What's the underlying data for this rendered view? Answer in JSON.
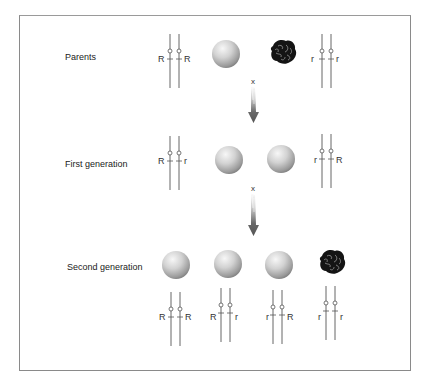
{
  "diagram": {
    "cross_symbol": "x",
    "rows": [
      {
        "label": "Parents",
        "items": [
          {
            "type": "chromosomes",
            "left": "R",
            "right": "R"
          },
          {
            "type": "seed",
            "phenotype": "round"
          },
          {
            "type": "seed",
            "phenotype": "wrinkled"
          },
          {
            "type": "chromosomes",
            "left": "r",
            "right": "r"
          }
        ]
      },
      {
        "label": "First generation",
        "items": [
          {
            "type": "chromosomes",
            "left": "R",
            "right": "r"
          },
          {
            "type": "seed",
            "phenotype": "round"
          },
          {
            "type": "seed",
            "phenotype": "round"
          },
          {
            "type": "chromosomes",
            "left": "r",
            "right": "R"
          }
        ]
      },
      {
        "label": "Second generation",
        "items": [
          {
            "type": "seed",
            "phenotype": "round",
            "genotype": {
              "left": "R",
              "right": "R"
            }
          },
          {
            "type": "seed",
            "phenotype": "round",
            "genotype": {
              "left": "R",
              "right": "r"
            }
          },
          {
            "type": "seed",
            "phenotype": "round",
            "genotype": {
              "left": "r",
              "right": "R"
            }
          },
          {
            "type": "seed",
            "phenotype": "wrinkled",
            "genotype": {
              "left": "r",
              "right": "r"
            }
          }
        ]
      }
    ],
    "colors": {
      "frame": "#8a8a8a",
      "line": "#555555",
      "arrow": "#555555",
      "seed_light": "#f4f4f4",
      "seed_dark": "#8e8e8e",
      "wrinkled": "#151515"
    }
  }
}
